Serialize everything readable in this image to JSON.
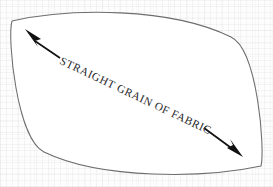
{
  "document": {
    "kind": "sewing-pattern-piece",
    "medium": "scanned paper"
  },
  "pattern_piece": {
    "name": "lens-shaped pattern piece",
    "shape": "pointed oval / lens (two arcs meeting at opposite tips)",
    "outline_color": "#6d6d70",
    "fill_color": "#ffffff",
    "left_tip": "12,21",
    "right_tip": "261,166"
  },
  "grain_marking": {
    "label": "STRAIGHT GRAIN OF FABRIC",
    "arrow_color": "#111111",
    "arrow_type": "double-headed",
    "head_upper_left": "25,29",
    "head_lower_right": "243,157",
    "label_orientation": "along the long axis, gently curved baseline"
  },
  "background": {
    "paper_color": "#fdfdfd",
    "texture": "faint woven grid"
  }
}
